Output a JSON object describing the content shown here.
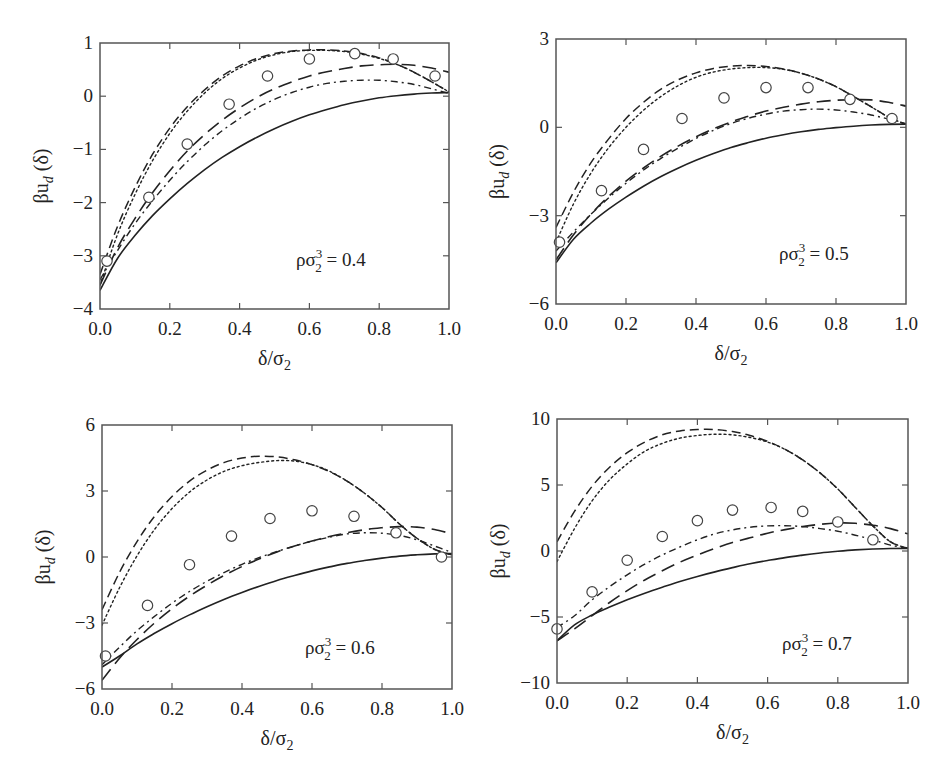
{
  "figure": {
    "xlabel": "δ/σ₂",
    "ylabel": "βu_d (δ)",
    "line_styles": {
      "solid": "",
      "long_dash": "14,7",
      "dash": "9,5",
      "dot": "2,3",
      "dash_dot": "7,4,2,4"
    },
    "ink_color": "#222222",
    "frame_color": "#555555"
  },
  "chart_data": [
    {
      "type": "line",
      "panel": "top-left",
      "annotation": "ρσ₂³ = 0.4",
      "annotation_parts": {
        "base": "ρσ",
        "sup": "3",
        "sub": "2",
        "rest": " = 0.4"
      },
      "xlabel": "δ/σ₂",
      "ylabel": "βu_d (δ)",
      "xlim": [
        0.0,
        1.0
      ],
      "ylim": [
        -4,
        1
      ],
      "xticks": [
        0.0,
        0.2,
        0.4,
        0.6,
        0.8,
        1.0
      ],
      "xtick_labels": [
        "0.0",
        "0.2",
        "0.4",
        "0.6",
        "0.8",
        "1.0"
      ],
      "yticks": [
        -4,
        -3,
        -2,
        -1,
        0,
        1
      ],
      "ytick_labels": [
        "−4",
        "−3",
        "−2",
        "−1",
        "0",
        "1"
      ],
      "grid": false,
      "box": {
        "left": 100,
        "top": 43,
        "right": 449,
        "bottom": 309
      },
      "annot_pos": {
        "x": 296,
        "y": 266
      },
      "x": [
        0.0,
        0.05,
        0.1,
        0.15,
        0.2,
        0.25,
        0.3,
        0.35,
        0.4,
        0.45,
        0.5,
        0.55,
        0.6,
        0.65,
        0.7,
        0.75,
        0.8,
        0.85,
        0.9,
        0.95,
        1.0
      ],
      "series": [
        {
          "name": "solid",
          "style": "solid",
          "width": 1.6,
          "values": [
            -3.65,
            -3.05,
            -2.62,
            -2.25,
            -1.93,
            -1.64,
            -1.38,
            -1.15,
            -0.95,
            -0.77,
            -0.61,
            -0.47,
            -0.35,
            -0.25,
            -0.16,
            -0.09,
            -0.03,
            0.01,
            0.04,
            0.06,
            0.07
          ]
        },
        {
          "name": "long-dash",
          "style": "long_dash",
          "width": 1.6,
          "values": [
            -3.55,
            -2.85,
            -2.3,
            -1.82,
            -1.4,
            -1.03,
            -0.72,
            -0.45,
            -0.22,
            -0.02,
            0.14,
            0.27,
            0.38,
            0.46,
            0.52,
            0.57,
            0.59,
            0.6,
            0.58,
            0.53,
            0.45
          ]
        },
        {
          "name": "dash",
          "style": "dash",
          "width": 1.5,
          "values": [
            -3.35,
            -2.45,
            -1.72,
            -1.1,
            -0.6,
            -0.2,
            0.12,
            0.38,
            0.57,
            0.71,
            0.8,
            0.85,
            0.87,
            0.87,
            0.85,
            0.8,
            0.72,
            0.6,
            0.45,
            0.27,
            0.08
          ]
        },
        {
          "name": "dotted",
          "style": "dot",
          "width": 1.4,
          "values": [
            -3.55,
            -2.6,
            -1.85,
            -1.22,
            -0.7,
            -0.28,
            0.06,
            0.33,
            0.53,
            0.68,
            0.78,
            0.84,
            0.86,
            0.86,
            0.84,
            0.79,
            0.71,
            0.6,
            0.45,
            0.27,
            0.08
          ]
        },
        {
          "name": "dash-dot",
          "style": "dash_dot",
          "width": 1.4,
          "values": [
            -3.45,
            -2.9,
            -2.4,
            -1.97,
            -1.58,
            -1.23,
            -0.92,
            -0.65,
            -0.42,
            -0.22,
            -0.06,
            0.07,
            0.17,
            0.24,
            0.28,
            0.3,
            0.3,
            0.27,
            0.22,
            0.14,
            0.05
          ]
        }
      ],
      "markers": {
        "name": "simulation",
        "symbol": "open-circle",
        "x": [
          0.02,
          0.14,
          0.25,
          0.37,
          0.48,
          0.6,
          0.73,
          0.84,
          0.96
        ],
        "y": [
          -3.1,
          -1.9,
          -0.9,
          -0.15,
          0.38,
          0.7,
          0.8,
          0.7,
          0.38
        ]
      }
    },
    {
      "type": "line",
      "panel": "top-right",
      "annotation": "ρσ₂³ = 0.5",
      "annotation_parts": {
        "base": "ρσ",
        "sup": "3",
        "sub": "2",
        "rest": " = 0.5"
      },
      "xlabel": "δ/σ₂",
      "ylabel": "βu_d (δ)",
      "xlim": [
        0.0,
        1.0
      ],
      "ylim": [
        -6,
        3
      ],
      "xticks": [
        0.0,
        0.2,
        0.4,
        0.6,
        0.8,
        1.0
      ],
      "xtick_labels": [
        "0.0",
        "0.2",
        "0.4",
        "0.6",
        "0.8",
        "1.0"
      ],
      "yticks": [
        -6,
        -3,
        0,
        3
      ],
      "ytick_labels": [
        "−6",
        "−3",
        "0",
        "3"
      ],
      "grid": false,
      "box": {
        "left": 556,
        "top": 39,
        "right": 906,
        "bottom": 304
      },
      "annot_pos": {
        "x": 779,
        "y": 260
      },
      "x": [
        0.0,
        0.05,
        0.1,
        0.15,
        0.2,
        0.25,
        0.3,
        0.35,
        0.4,
        0.45,
        0.5,
        0.55,
        0.6,
        0.65,
        0.7,
        0.75,
        0.8,
        0.85,
        0.9,
        0.95,
        1.0
      ],
      "series": [
        {
          "name": "solid",
          "style": "solid",
          "width": 1.6,
          "values": [
            -4.6,
            -3.8,
            -3.25,
            -2.78,
            -2.37,
            -2.0,
            -1.67,
            -1.38,
            -1.12,
            -0.89,
            -0.69,
            -0.52,
            -0.37,
            -0.25,
            -0.15,
            -0.07,
            -0.01,
            0.04,
            0.08,
            0.1,
            0.11
          ]
        },
        {
          "name": "long-dash",
          "style": "long_dash",
          "width": 1.6,
          "values": [
            -4.5,
            -3.65,
            -2.95,
            -2.35,
            -1.83,
            -1.38,
            -0.98,
            -0.63,
            -0.32,
            -0.05,
            0.18,
            0.38,
            0.55,
            0.68,
            0.79,
            0.87,
            0.92,
            0.94,
            0.93,
            0.85,
            0.72
          ]
        },
        {
          "name": "dash",
          "style": "dash",
          "width": 1.5,
          "values": [
            -3.4,
            -2.2,
            -1.2,
            -0.4,
            0.3,
            0.85,
            1.3,
            1.62,
            1.85,
            2.0,
            2.08,
            2.1,
            2.07,
            1.98,
            1.84,
            1.64,
            1.38,
            1.05,
            0.7,
            0.35,
            0.1
          ]
        },
        {
          "name": "dotted",
          "style": "dot",
          "width": 1.4,
          "values": [
            -3.9,
            -2.6,
            -1.55,
            -0.7,
            0.0,
            0.58,
            1.05,
            1.42,
            1.7,
            1.88,
            1.98,
            2.03,
            2.03,
            1.97,
            1.84,
            1.64,
            1.38,
            1.05,
            0.7,
            0.35,
            0.1
          ]
        },
        {
          "name": "dash-dot",
          "style": "dash_dot",
          "width": 1.4,
          "values": [
            -4.2,
            -3.55,
            -2.95,
            -2.4,
            -1.9,
            -1.45,
            -1.05,
            -0.7,
            -0.38,
            -0.1,
            0.13,
            0.31,
            0.45,
            0.55,
            0.6,
            0.62,
            0.59,
            0.52,
            0.42,
            0.28,
            0.12
          ]
        }
      ],
      "markers": {
        "name": "simulation",
        "symbol": "open-circle",
        "x": [
          0.01,
          0.13,
          0.25,
          0.36,
          0.48,
          0.6,
          0.72,
          0.84,
          0.96
        ],
        "y": [
          -3.9,
          -2.15,
          -0.75,
          0.3,
          1.0,
          1.35,
          1.35,
          0.95,
          0.3
        ]
      }
    },
    {
      "type": "line",
      "panel": "bottom-left",
      "annotation": "ρσ₂³ = 0.6",
      "annotation_parts": {
        "base": "ρσ",
        "sup": "3",
        "sub": "2",
        "rest": " = 0.6"
      },
      "xlabel": "δ/σ₂",
      "ylabel": "βu_d (δ)",
      "xlim": [
        0.0,
        1.0
      ],
      "ylim": [
        -6,
        6
      ],
      "xticks": [
        0.0,
        0.2,
        0.4,
        0.6,
        0.8,
        1.0
      ],
      "xtick_labels": [
        "0.0",
        "0.2",
        "0.4",
        "0.6",
        "0.8",
        "1.0"
      ],
      "yticks": [
        -6,
        -3,
        0,
        3,
        6
      ],
      "ytick_labels": [
        "−6",
        "−3",
        "0",
        "3",
        "6"
      ],
      "grid": false,
      "box": {
        "left": 102,
        "top": 425,
        "right": 452,
        "bottom": 689
      },
      "annot_pos": {
        "x": 305,
        "y": 654
      },
      "x": [
        0.0,
        0.05,
        0.1,
        0.15,
        0.2,
        0.25,
        0.3,
        0.35,
        0.4,
        0.45,
        0.5,
        0.55,
        0.6,
        0.65,
        0.7,
        0.75,
        0.8,
        0.85,
        0.9,
        0.95,
        1.0
      ],
      "series": [
        {
          "name": "solid",
          "style": "solid",
          "width": 1.6,
          "values": [
            -5.0,
            -4.5,
            -3.95,
            -3.47,
            -3.03,
            -2.63,
            -2.26,
            -1.92,
            -1.61,
            -1.33,
            -1.07,
            -0.84,
            -0.63,
            -0.45,
            -0.29,
            -0.16,
            -0.05,
            0.04,
            0.1,
            0.14,
            0.16
          ]
        },
        {
          "name": "long-dash",
          "style": "long_dash",
          "width": 1.6,
          "values": [
            -5.6,
            -4.6,
            -3.75,
            -3.0,
            -2.35,
            -1.78,
            -1.28,
            -0.83,
            -0.43,
            -0.08,
            0.23,
            0.5,
            0.73,
            0.93,
            1.1,
            1.24,
            1.33,
            1.38,
            1.36,
            1.25,
            1.05
          ]
        },
        {
          "name": "dash",
          "style": "dash",
          "width": 1.5,
          "values": [
            -2.4,
            -0.7,
            0.7,
            1.85,
            2.75,
            3.45,
            3.95,
            4.3,
            4.5,
            4.58,
            4.55,
            4.42,
            4.2,
            3.88,
            3.45,
            2.9,
            2.25,
            1.5,
            0.85,
            0.35,
            0.1
          ]
        },
        {
          "name": "dotted",
          "style": "dot",
          "width": 1.4,
          "values": [
            -3.1,
            -1.4,
            0.05,
            1.25,
            2.2,
            2.95,
            3.5,
            3.9,
            4.15,
            4.3,
            4.38,
            4.36,
            4.2,
            3.9,
            3.45,
            2.9,
            2.25,
            1.5,
            0.85,
            0.35,
            0.1
          ]
        },
        {
          "name": "dash-dot",
          "style": "dash_dot",
          "width": 1.4,
          "values": [
            -4.9,
            -4.1,
            -3.35,
            -2.7,
            -2.1,
            -1.57,
            -1.1,
            -0.7,
            -0.33,
            -0.02,
            0.25,
            0.5,
            0.72,
            0.9,
            1.05,
            1.1,
            1.08,
            0.98,
            0.78,
            0.5,
            0.2
          ]
        }
      ],
      "markers": {
        "name": "simulation",
        "symbol": "open-circle",
        "x": [
          0.01,
          0.13,
          0.25,
          0.37,
          0.48,
          0.6,
          0.72,
          0.84,
          0.97
        ],
        "y": [
          -4.5,
          -2.2,
          -0.35,
          0.95,
          1.75,
          2.1,
          1.85,
          1.1,
          0.0
        ]
      }
    },
    {
      "type": "line",
      "panel": "bottom-right",
      "annotation": "ρσ₂³ = 0.7",
      "annotation_parts": {
        "base": "ρσ",
        "sup": "3",
        "sub": "2",
        "rest": " = 0.7"
      },
      "xlabel": "δ/σ₂",
      "ylabel": "βu_d (δ)",
      "xlim": [
        0.0,
        1.0
      ],
      "ylim": [
        -10,
        10
      ],
      "xticks": [
        0.0,
        0.2,
        0.4,
        0.6,
        0.8,
        1.0
      ],
      "xtick_labels": [
        "0.0",
        "0.2",
        "0.4",
        "0.6",
        "0.8",
        "1.0"
      ],
      "yticks": [
        -10,
        -5,
        0,
        5,
        10
      ],
      "ytick_labels": [
        "−10",
        "−5",
        "0",
        "5",
        "10"
      ],
      "grid": false,
      "box": {
        "left": 557,
        "top": 419,
        "right": 908,
        "bottom": 683
      },
      "annot_pos": {
        "x": 782,
        "y": 650
      },
      "x": [
        0.0,
        0.05,
        0.1,
        0.15,
        0.2,
        0.25,
        0.3,
        0.35,
        0.4,
        0.45,
        0.5,
        0.55,
        0.6,
        0.65,
        0.7,
        0.75,
        0.8,
        0.85,
        0.9,
        0.95,
        1.0
      ],
      "series": [
        {
          "name": "solid",
          "style": "solid",
          "width": 1.6,
          "values": [
            -6.8,
            -5.6,
            -4.85,
            -4.25,
            -3.7,
            -3.2,
            -2.75,
            -2.32,
            -1.93,
            -1.58,
            -1.26,
            -0.97,
            -0.72,
            -0.5,
            -0.31,
            -0.15,
            -0.02,
            0.08,
            0.15,
            0.19,
            0.2
          ]
        },
        {
          "name": "long-dash",
          "style": "long_dash",
          "width": 1.6,
          "values": [
            -6.8,
            -5.9,
            -4.9,
            -3.9,
            -3.0,
            -2.2,
            -1.5,
            -0.85,
            -0.3,
            0.2,
            0.65,
            1.0,
            1.35,
            1.62,
            1.85,
            2.02,
            2.12,
            2.1,
            1.95,
            1.7,
            1.3
          ]
        },
        {
          "name": "dash",
          "style": "dash",
          "width": 1.5,
          "values": [
            0.7,
            3.0,
            4.9,
            6.35,
            7.45,
            8.25,
            8.8,
            9.1,
            9.2,
            9.2,
            9.05,
            8.75,
            8.3,
            7.7,
            6.9,
            5.9,
            4.7,
            3.3,
            1.9,
            0.7,
            0.2
          ]
        },
        {
          "name": "dotted",
          "style": "dot",
          "width": 1.4,
          "values": [
            -0.8,
            1.7,
            3.8,
            5.4,
            6.6,
            7.55,
            8.15,
            8.55,
            8.75,
            8.85,
            8.8,
            8.6,
            8.25,
            7.7,
            6.9,
            5.9,
            4.7,
            3.3,
            1.9,
            0.7,
            0.2
          ]
        },
        {
          "name": "dash-dot",
          "style": "dash_dot",
          "width": 1.4,
          "values": [
            -5.8,
            -4.9,
            -3.7,
            -2.7,
            -1.8,
            -1.0,
            -0.3,
            0.3,
            0.85,
            1.3,
            1.6,
            1.8,
            1.9,
            1.92,
            1.85,
            1.7,
            1.5,
            1.2,
            0.85,
            0.45,
            0.2
          ]
        }
      ],
      "markers": {
        "name": "simulation",
        "symbol": "open-circle",
        "x": [
          0.0,
          0.1,
          0.2,
          0.3,
          0.4,
          0.5,
          0.61,
          0.7,
          0.8,
          0.9
        ],
        "y": [
          -5.9,
          -3.1,
          -0.7,
          1.1,
          2.3,
          3.1,
          3.3,
          3.0,
          2.2,
          0.85
        ]
      }
    }
  ]
}
